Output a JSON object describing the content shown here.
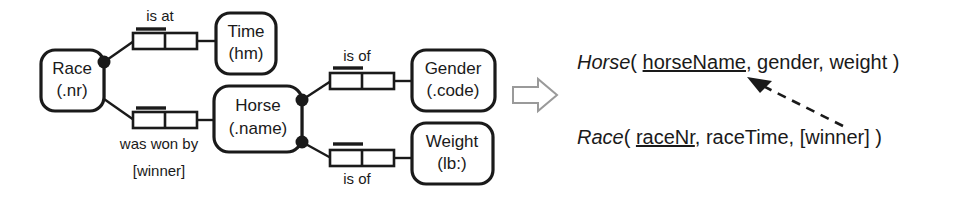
{
  "figure": {
    "type": "orm-conceptual-schema-to-relational-mapping",
    "transform_arrow_icon": "block-arrow-right-icon"
  },
  "orm_diagram": {
    "entity_types": [
      {
        "id": "race",
        "name": "Race",
        "reference_mode": "(.nr)",
        "label": "Race (.nr)"
      },
      {
        "id": "time",
        "name": "Time",
        "reference_mode": "(hm)",
        "label": "Time (hm)"
      },
      {
        "id": "horse",
        "name": "Horse",
        "reference_mode": "(.name)",
        "label": "Horse (.name)"
      },
      {
        "id": "gender",
        "name": "Gender",
        "reference_mode": "(.code)",
        "label": "Gender (.code)"
      },
      {
        "id": "weight",
        "name": "Weight",
        "reference_mode": "(lb:)",
        "label": "Weight (lb:)"
      }
    ],
    "fact_types": [
      {
        "id": "race-is-at-time",
        "predicate": "is at",
        "predicate_position": "above",
        "roles": 2,
        "uniqueness_constraint": "first-role",
        "from": "race",
        "to": "time"
      },
      {
        "id": "race-was-won-by-horse",
        "predicate": "was won by",
        "role_name": "[winner]",
        "predicate_position": "below",
        "roles": 2,
        "uniqueness_constraint": "first-role",
        "from": "race",
        "to": "horse"
      },
      {
        "id": "gender-is-of-horse",
        "predicate": "is of",
        "predicate_position": "above",
        "roles": 2,
        "uniqueness_constraint": "first-role",
        "from": "horse",
        "to": "gender"
      },
      {
        "id": "weight-is-of-horse",
        "predicate": "is of",
        "predicate_position": "below",
        "roles": 2,
        "uniqueness_constraint": "first-role",
        "from": "horse",
        "to": "weight"
      }
    ]
  },
  "relational_schema": {
    "tables": [
      {
        "id": "horse-table",
        "name": "Horse",
        "open_paren": "( ",
        "close_paren": " )",
        "primary_key": "horseName",
        "separator": ", ",
        "columns": [
          "gender",
          "weight"
        ],
        "full_text": "Horse ( horseName, gender, weight )"
      },
      {
        "id": "race-table",
        "name": "Race",
        "open_paren": "( ",
        "close_paren": " )",
        "primary_key": "raceNr",
        "separator": ", ",
        "columns": [
          "raceTime",
          "[winner]"
        ],
        "full_text": "Race ( raceNr, raceTime, [winner] )"
      }
    ],
    "foreign_key_arrow": {
      "id": "winner-to-horsename-fk",
      "style": "dashed",
      "from_column": "[winner]",
      "to_column": "horseName"
    }
  },
  "colors": {
    "ink": "#1a1a1a",
    "paper": "#ffffff",
    "arrow_outline": "#9a9a9a"
  }
}
